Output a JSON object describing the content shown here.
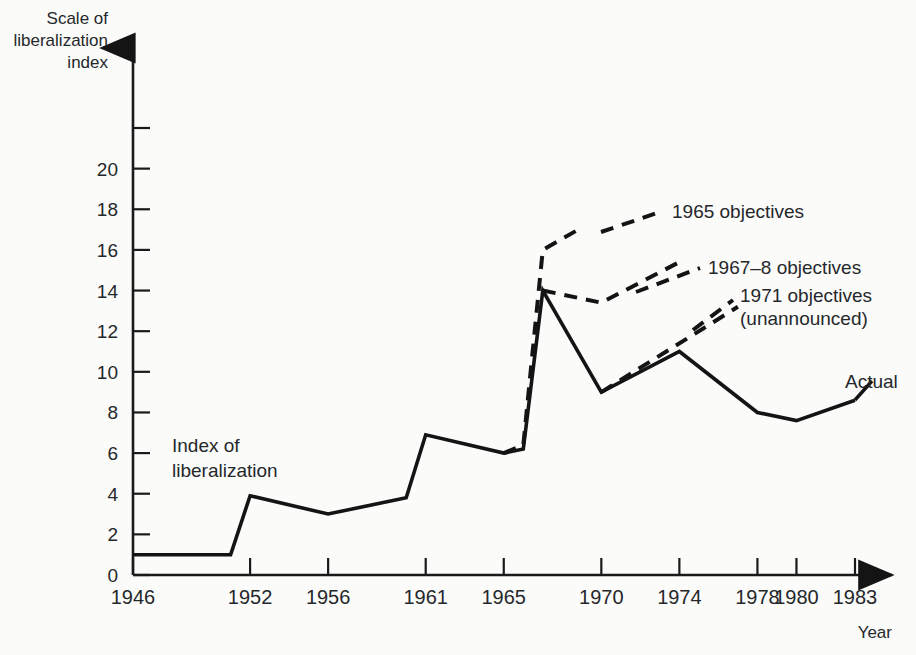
{
  "chart_data": {
    "type": "line",
    "title": "",
    "xlabel": "Year",
    "ylabel": "Scale of liberalization index",
    "ylabel_lines": [
      "Scale of",
      "liberalization",
      "index"
    ],
    "xlim": [
      1946,
      1983
    ],
    "ylim": [
      0,
      22
    ],
    "grid": false,
    "legend_position": "inline-annotations",
    "y_ticks": [
      0,
      2,
      4,
      6,
      8,
      10,
      12,
      14,
      16,
      18,
      20,
      22
    ],
    "y_tick_labels": [
      "0",
      "2",
      "4",
      "6",
      "8",
      "10",
      "12",
      "14",
      "16",
      "18",
      "20",
      ""
    ],
    "x_ticks": [
      1946,
      1952,
      1956,
      1961,
      1965,
      1970,
      1974,
      1978,
      1980,
      1983
    ],
    "x_tick_labels": [
      "1946",
      "1952",
      "1956",
      "1961",
      "1965",
      "1970",
      "1974",
      "1978",
      "1980",
      "1983"
    ],
    "inner_note_lines": [
      "Index of",
      "liberalization"
    ],
    "series": [
      {
        "name": "Actual",
        "style": "solid",
        "label": "Actual",
        "points": [
          {
            "x": 1946,
            "y": 1.0
          },
          {
            "x": 1951,
            "y": 1.0
          },
          {
            "x": 1952,
            "y": 3.9
          },
          {
            "x": 1956,
            "y": 3.0
          },
          {
            "x": 1960,
            "y": 3.8
          },
          {
            "x": 1961,
            "y": 6.9
          },
          {
            "x": 1965,
            "y": 6.0
          },
          {
            "x": 1966,
            "y": 6.2
          },
          {
            "x": 1967,
            "y": 14.0
          },
          {
            "x": 1970,
            "y": 9.0
          },
          {
            "x": 1974,
            "y": 11.0
          },
          {
            "x": 1978,
            "y": 8.0
          },
          {
            "x": 1980,
            "y": 7.6
          },
          {
            "x": 1983,
            "y": 8.6
          }
        ]
      },
      {
        "name": "1965 objectives",
        "style": "dashed",
        "label": "1965 objectives",
        "points": [
          {
            "x": 1965,
            "y": 6.0
          },
          {
            "x": 1966,
            "y": 6.4
          },
          {
            "x": 1967,
            "y": 16.0
          },
          {
            "x": 1969,
            "y": 17.1
          }
        ]
      },
      {
        "name": "1967-8 objectives",
        "style": "dashed",
        "label": "1967–8 objectives",
        "points": [
          {
            "x": 1967,
            "y": 14.0
          },
          {
            "x": 1970,
            "y": 13.4
          },
          {
            "x": 1974,
            "y": 15.4
          }
        ]
      },
      {
        "name": "1971 objectives (unannounced)",
        "style": "dashed",
        "label_lines": [
          "1971 objectives",
          "(unannounced)"
        ],
        "points": [
          {
            "x": 1970,
            "y": 9.0
          },
          {
            "x": 1977,
            "y": 13.2
          }
        ]
      }
    ],
    "annotations": [
      {
        "name": "1965-objectives-label",
        "text": "1965 objectives"
      },
      {
        "name": "1967-8-objectives-label",
        "text": "1967–8 objectives"
      },
      {
        "name": "1971-objectives-label-line1",
        "text": "1971 objectives"
      },
      {
        "name": "1971-objectives-label-line2",
        "text": "(unannounced)"
      },
      {
        "name": "actual-label",
        "text": "Actual"
      }
    ],
    "colors": {
      "line": "#141414",
      "text": "#25282b",
      "background": "#fbfbfa"
    }
  }
}
